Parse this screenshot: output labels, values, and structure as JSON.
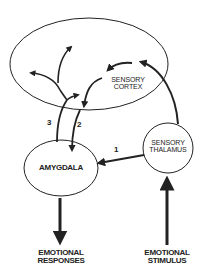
{
  "diagram": {
    "title": "",
    "nodes": {
      "cortex": {
        "line1": "SENSORY",
        "line2": "CORTEX"
      },
      "thalamus": {
        "line1": "SENSORY",
        "line2": "THALAMUS"
      },
      "amygdala": {
        "label": "AMYGDALA"
      }
    },
    "outputs": {
      "responses": {
        "line1": "EMOTIONAL",
        "line2": "RESPONSES"
      },
      "stimulus": {
        "line1": "EMOTIONAL",
        "line2": "STIMULUS"
      }
    },
    "pathways": {
      "p1": "1",
      "p2": "2",
      "p3": "3"
    },
    "colors": {
      "stroke": "#222222",
      "background": "#ffffff"
    }
  }
}
